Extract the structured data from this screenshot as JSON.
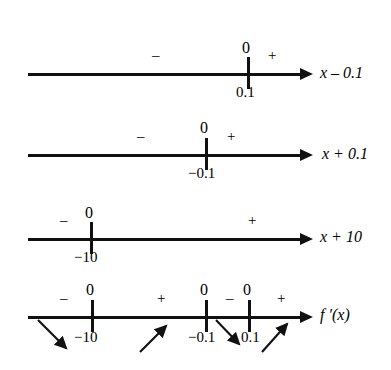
{
  "figure": {
    "type": "sign-chart",
    "title": "",
    "background": "#ffffff",
    "ink": "#111111",
    "lines": [
      {
        "id": "line-1",
        "label": "x – 0.1",
        "label_parts": {
          "variable": "x",
          "operator": "–",
          "constant": "0.1"
        },
        "axis": {
          "x1": 28,
          "x2": 300,
          "y": 73
        },
        "arrow_tip_x": 313,
        "label_x": 320,
        "label_y": 66,
        "ticks": [
          {
            "value": "0.1",
            "x": 247,
            "zero_label": "0",
            "zero_y": 44,
            "value_y": 85
          }
        ],
        "signs": [
          {
            "symbol": "–",
            "x": 152,
            "y": 48
          },
          {
            "symbol": "+",
            "x": 268,
            "y": 48
          }
        ]
      },
      {
        "id": "line-2",
        "label": "x + 0.1",
        "label_parts": {
          "variable": "x",
          "operator": "+",
          "constant": "0.1"
        },
        "axis": {
          "x1": 28,
          "x2": 300,
          "y": 154
        },
        "arrow_tip_x": 313,
        "label_x": 322,
        "label_y": 147,
        "ticks": [
          {
            "value": "−0.1",
            "x": 205,
            "zero_label": "0",
            "zero_y": 124,
            "value_y": 166
          }
        ],
        "signs": [
          {
            "symbol": "–",
            "x": 137,
            "y": 130
          },
          {
            "symbol": "+",
            "x": 227,
            "y": 130
          }
        ]
      },
      {
        "id": "line-3",
        "label": "x + 10",
        "label_parts": {
          "variable": "x",
          "operator": "+",
          "constant": "10"
        },
        "axis": {
          "x1": 28,
          "x2": 300,
          "y": 238
        },
        "arrow_tip_x": 313,
        "label_x": 320,
        "label_y": 230,
        "ticks": [
          {
            "value": "−10",
            "x": 90,
            "zero_label": "0",
            "zero_y": 209,
            "value_y": 250
          }
        ],
        "signs": [
          {
            "symbol": "–",
            "x": 62,
            "y": 213
          },
          {
            "symbol": "+",
            "x": 248,
            "y": 213
          }
        ]
      },
      {
        "id": "line-4",
        "label": "f ′(x)",
        "label_parts": {
          "variable": "f",
          "operator": "′",
          "constant": "(x)"
        },
        "axis": {
          "x1": 28,
          "x2": 300,
          "y": 316
        },
        "arrow_tip_x": 313,
        "label_x": 320,
        "label_y": 308,
        "ticks": [
          {
            "value": "−10",
            "x": 91,
            "zero_label": "0",
            "zero_y": 286,
            "value_y": 330
          },
          {
            "value": "−0.1",
            "x": 205,
            "zero_label": "0",
            "zero_y": 286,
            "value_y": 330
          },
          {
            "value": "0.1",
            "x": 248,
            "zero_label": "0",
            "zero_y": 286,
            "value_y": 330
          }
        ],
        "signs": [
          {
            "symbol": "–",
            "x": 62,
            "y": 291
          },
          {
            "symbol": "+",
            "x": 157,
            "y": 291
          },
          {
            "symbol": "–",
            "x": 226,
            "y": 291
          },
          {
            "symbol": "+",
            "x": 277,
            "y": 291
          }
        ],
        "slope_arrows": [
          {
            "direction": "down-right",
            "x1": 38,
            "y1": 320,
            "x2": 68,
            "y2": 350
          },
          {
            "direction": "up-right",
            "x1": 140,
            "y1": 352,
            "x2": 168,
            "y2": 324
          },
          {
            "direction": "down-right",
            "x1": 216,
            "y1": 320,
            "x2": 241,
            "y2": 346
          },
          {
            "direction": "up-right",
            "x1": 262,
            "y1": 352,
            "x2": 289,
            "y2": 322
          }
        ]
      }
    ]
  }
}
